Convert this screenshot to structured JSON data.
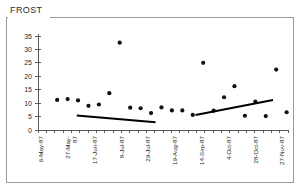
{
  "chart_title": "FROST",
  "chart_data": {
    "type": "scatter",
    "title": "FROST",
    "xlabel": "",
    "ylabel": "",
    "ylim": [
      0,
      35
    ],
    "yticks": [
      0,
      5,
      10,
      15,
      20,
      25,
      30,
      35
    ],
    "ytick_labels": [
      "0",
      "5",
      "10",
      "15",
      "20",
      "25",
      "30",
      "35"
    ],
    "grid": false,
    "legend": "none",
    "x_tick_labels": [
      "6-May-87",
      "27-May-87",
      "17-Jun-87",
      "8-Jul-87",
      "29-Jul-87",
      "19-Aug-87",
      "14-Sep-87",
      "4-Oct-87",
      "28-Oct-87",
      "27-Nov-87"
    ],
    "x_tick_label_lines": [
      [
        "6-May-87"
      ],
      [
        "27-May-",
        "87"
      ],
      [
        "17-Jun-87"
      ],
      [
        "8-Jul-87"
      ],
      [
        "29-Jul-87"
      ],
      [
        "19-Aug-87"
      ],
      [
        "14-Sep-87"
      ],
      [
        "4-Oct-87"
      ],
      [
        "28-Oct-87"
      ],
      [
        "27-Nov-87"
      ]
    ],
    "x_minor_tick_count": 31,
    "points": [
      {
        "x": "6-May-87",
        "index": 1,
        "value": 11.2
      },
      {
        "x": "13-May-87",
        "index": 2,
        "value": 11.5
      },
      {
        "x": "20-May-87",
        "index": 3,
        "value": 11.0
      },
      {
        "x": "27-May-87",
        "index": 4,
        "value": 9.0
      },
      {
        "x": "3-Jun-87",
        "index": 5,
        "value": 9.5
      },
      {
        "x": "17-Jun-87",
        "index": 6,
        "value": 13.7
      },
      {
        "x": "24-Jun-87",
        "index": 7,
        "value": 32.5
      },
      {
        "x": "8-Jul-87",
        "index": 8,
        "value": 8.3
      },
      {
        "x": "15-Jul-87",
        "index": 9,
        "value": 8.1
      },
      {
        "x": "22-Jul-87",
        "index": 10,
        "value": 6.3
      },
      {
        "x": "29-Jul-87",
        "index": 11,
        "value": 8.4
      },
      {
        "x": "5-Aug-87",
        "index": 12,
        "value": 7.3
      },
      {
        "x": "12-Aug-87",
        "index": 13,
        "value": 7.3
      },
      {
        "x": "19-Aug-87",
        "index": 14,
        "value": 5.6
      },
      {
        "x": "26-Aug-87",
        "index": 15,
        "value": 25.0
      },
      {
        "x": "7-Sep-87",
        "index": 16,
        "value": 7.2
      },
      {
        "x": "14-Sep-87",
        "index": 17,
        "value": 12.2
      },
      {
        "x": "21-Sep-87",
        "index": 18,
        "value": 16.3
      },
      {
        "x": "28-Sep-87",
        "index": 19,
        "value": 5.3
      },
      {
        "x": "4-Oct-87",
        "index": 20,
        "value": 10.6
      },
      {
        "x": "18-Oct-87",
        "index": 21,
        "value": 5.2
      },
      {
        "x": "28-Oct-87",
        "index": 22,
        "value": 22.5
      },
      {
        "x": "27-Nov-87",
        "index": 23,
        "value": 6.6
      }
    ],
    "trend_lines": [
      {
        "name": "trend-segment-1",
        "x_start": 0.155,
        "y_start": 5.4,
        "x_end": 0.47,
        "y_end": 2.9,
        "direction": "decreasing"
      },
      {
        "name": "trend-segment-2",
        "x_start": 0.63,
        "y_start": 5.6,
        "x_end": 0.94,
        "y_end": 11.2,
        "direction": "increasing"
      }
    ]
  }
}
